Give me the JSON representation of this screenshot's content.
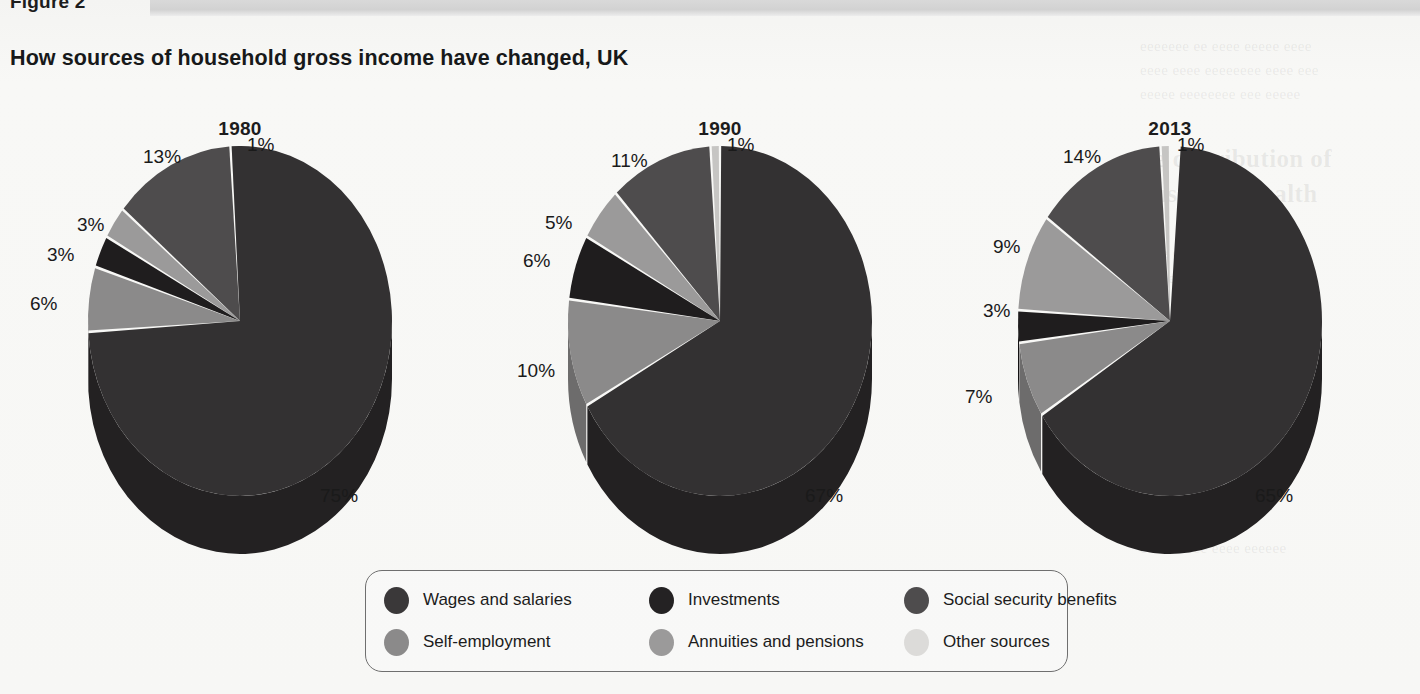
{
  "figure": {
    "label": "Figure 2",
    "title": "How sources of household gross income have changed, UK"
  },
  "colors": {
    "wages": "#333132",
    "wages_side": "#232122",
    "investments": "#1f1d1e",
    "investments_side": "#141213",
    "social_security": "#4e4c4d",
    "social_security_side": "#3a3839",
    "self_employment": "#8b8a8a",
    "self_employment_side": "#6d6c6c",
    "annuities": "#9b9a9a",
    "annuities_side": "#7c7b7b",
    "other": "#c6c5c3",
    "other_side": "#a9a8a6",
    "legend_border": "#6f6f6f",
    "text": "#1a1a1a",
    "bar": "#d4d4d4"
  },
  "legend": {
    "items": [
      {
        "label": "Wages and salaries",
        "key": "wages",
        "swatch": "#3a3839"
      },
      {
        "label": "Investments",
        "key": "investments",
        "swatch": "#242223"
      },
      {
        "label": "Social security benefits",
        "key": "social_security",
        "swatch": "#4e4c4d"
      },
      {
        "label": "Self-employment",
        "key": "self_employment",
        "swatch": "#8b8a8a"
      },
      {
        "label": "Annuities and pensions",
        "key": "annuities",
        "swatch": "#9b9a9a"
      },
      {
        "label": "Other sources",
        "key": "other",
        "swatch": "#dcdbd9"
      }
    ]
  },
  "chart_data": {
    "type": "pie",
    "title": "How sources of household gross income have changed, UK",
    "subtitle": "Figure 2",
    "unit": "percent",
    "legend_position": "bottom",
    "categories": [
      "Wages and salaries",
      "Investments",
      "Social security benefits",
      "Self-employment",
      "Annuities and pensions",
      "Other sources"
    ],
    "charts": [
      {
        "name": "1980",
        "slices": [
          {
            "label": "Other sources",
            "value": 1,
            "text": "1%"
          },
          {
            "label": "Social security benefits",
            "value": 13,
            "text": "13%"
          },
          {
            "label": "Annuities and pensions",
            "value": 3,
            "text": "3%"
          },
          {
            "label": "Investments",
            "value": 3,
            "text": "3%"
          },
          {
            "label": "Self-employment",
            "value": 6,
            "text": "6%"
          },
          {
            "label": "Wages and salaries",
            "value": 75,
            "text": "75%"
          }
        ]
      },
      {
        "name": "1990",
        "slices": [
          {
            "label": "Other sources",
            "value": 1,
            "text": "1%"
          },
          {
            "label": "Social security benefits",
            "value": 11,
            "text": "11%"
          },
          {
            "label": "Annuities and pensions",
            "value": 5,
            "text": "5%"
          },
          {
            "label": "Investments",
            "value": 6,
            "text": "6%"
          },
          {
            "label": "Self-employment",
            "value": 10,
            "text": "10%"
          },
          {
            "label": "Wages and salaries",
            "value": 67,
            "text": "67%"
          }
        ]
      },
      {
        "name": "2013",
        "slices": [
          {
            "label": "Other sources",
            "value": 1,
            "text": "1%"
          },
          {
            "label": "Social security benefits",
            "value": 14,
            "text": "14%"
          },
          {
            "label": "Annuities and pensions",
            "value": 9,
            "text": "9%"
          },
          {
            "label": "Investments",
            "value": 3,
            "text": "3%"
          },
          {
            "label": "Self-employment",
            "value": 7,
            "text": "7%"
          },
          {
            "label": "Wages and salaries",
            "value": 65,
            "text": "65%"
          }
        ]
      }
    ]
  },
  "labels": {
    "y1980": {
      "year": "1980",
      "other": "1%",
      "social": "13%",
      "annuities": "3%",
      "investments": "3%",
      "selfemp": "6%",
      "wages": "75%"
    },
    "y1990": {
      "year": "1990",
      "other": "1%",
      "social": "11%",
      "annuities": "5%",
      "investments": "6%",
      "selfemp": "10%",
      "wages": "67%"
    },
    "y2013": {
      "year": "2013",
      "other": "1%",
      "social": "14%",
      "annuities": "9%",
      "investments": "3%",
      "selfemp": "7%",
      "wages": "65%"
    }
  }
}
